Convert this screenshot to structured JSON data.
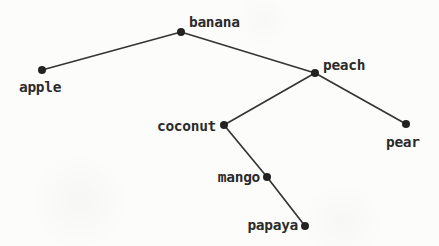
{
  "diagram": {
    "type": "tree",
    "background_color": "#fcfcfb",
    "line_color": "#353535",
    "dot_color": "#232323",
    "text_color": "#2b2b2b",
    "dot_radius": 4,
    "line_width": 1.7,
    "root": "banana",
    "nodes": [
      {
        "id": "banana",
        "label": "banana",
        "x": 181,
        "y": 32,
        "label_x": 189,
        "label_y": 27,
        "label_anchor": "start"
      },
      {
        "id": "apple",
        "label": "apple",
        "x": 42,
        "y": 70,
        "label_x": 19,
        "label_y": 92,
        "label_anchor": "start"
      },
      {
        "id": "peach",
        "label": "peach",
        "x": 315,
        "y": 73,
        "label_x": 323,
        "label_y": 70,
        "label_anchor": "start"
      },
      {
        "id": "coconut",
        "label": "coconut",
        "x": 224,
        "y": 125,
        "label_x": 216,
        "label_y": 131,
        "label_anchor": "end"
      },
      {
        "id": "pear",
        "label": "pear",
        "x": 406,
        "y": 124,
        "label_x": 386,
        "label_y": 147,
        "label_anchor": "start"
      },
      {
        "id": "mango",
        "label": "mango",
        "x": 267,
        "y": 177,
        "label_x": 260,
        "label_y": 182,
        "label_anchor": "end"
      },
      {
        "id": "papaya",
        "label": "papaya",
        "x": 305,
        "y": 226,
        "label_x": 298,
        "label_y": 230,
        "label_anchor": "end"
      }
    ],
    "edges": [
      {
        "from": "banana",
        "to": "apple"
      },
      {
        "from": "banana",
        "to": "peach"
      },
      {
        "from": "peach",
        "to": "coconut"
      },
      {
        "from": "peach",
        "to": "pear"
      },
      {
        "from": "coconut",
        "to": "mango"
      },
      {
        "from": "mango",
        "to": "papaya"
      }
    ]
  }
}
